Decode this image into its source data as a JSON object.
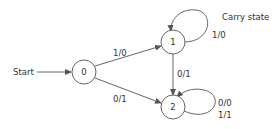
{
  "diagram": {
    "type": "finite-state-machine",
    "start_label": "Start",
    "annotation": "Carry state",
    "states": [
      {
        "id": "0",
        "label": "0"
      },
      {
        "id": "1",
        "label": "1"
      },
      {
        "id": "2",
        "label": "2"
      }
    ],
    "transitions": [
      {
        "from": "0",
        "to": "1",
        "label": "1/0"
      },
      {
        "from": "0",
        "to": "2",
        "label": "0/1"
      },
      {
        "from": "1",
        "to": "2",
        "label": "0/1"
      },
      {
        "from": "1",
        "to": "1",
        "label": "1/0"
      },
      {
        "from": "2",
        "to": "2",
        "label_line1": "0/0",
        "label_line2": "1/1"
      }
    ],
    "colors": {
      "stroke": "#555555",
      "text": "#333333",
      "background": "#ffffff"
    }
  }
}
